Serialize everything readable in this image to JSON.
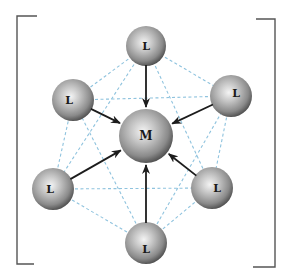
{
  "figure": {
    "central_atom": {
      "id": "M",
      "label": "M",
      "cx": 146,
      "cy": 136,
      "r": 27
    },
    "ligands": [
      {
        "id": "top",
        "label": "L",
        "cx": 146,
        "cy": 46,
        "r": 20,
        "label_dx": 0,
        "label_dy": 0
      },
      {
        "id": "upper-left",
        "label": "L",
        "cx": 73,
        "cy": 100,
        "r": 21,
        "label_dx": -4,
        "label_dy": 0
      },
      {
        "id": "upper-right",
        "label": "L",
        "cx": 231,
        "cy": 96,
        "r": 21,
        "label_dx": 5,
        "label_dy": -3
      },
      {
        "id": "lower-left",
        "label": "L",
        "cx": 53,
        "cy": 189,
        "r": 21,
        "label_dx": -3,
        "label_dy": 0
      },
      {
        "id": "lower-right",
        "label": "L",
        "cx": 212,
        "cy": 188,
        "r": 21,
        "label_dx": 5,
        "label_dy": 0
      },
      {
        "id": "bottom",
        "label": "L",
        "cx": 146,
        "cy": 243,
        "r": 21,
        "label_dx": 0,
        "label_dy": 6
      }
    ],
    "octahedron_edges": [
      [
        "top",
        "upper-left"
      ],
      [
        "top",
        "upper-right"
      ],
      [
        "top",
        "lower-left"
      ],
      [
        "top",
        "lower-right"
      ],
      [
        "bottom",
        "upper-left"
      ],
      [
        "bottom",
        "upper-right"
      ],
      [
        "bottom",
        "lower-left"
      ],
      [
        "bottom",
        "lower-right"
      ],
      [
        "upper-left",
        "upper-right"
      ],
      [
        "lower-left",
        "lower-right"
      ],
      [
        "upper-left",
        "lower-left"
      ],
      [
        "upper-right",
        "lower-right"
      ]
    ],
    "arrows_direction": "ligand-to-metal",
    "colors": {
      "edge_dashed": "#8fc3de",
      "arrow": "#1c1c1c",
      "bracket": "#555555",
      "sphere_light": "#f2f2f2",
      "sphere_mid": "#9a9a9a",
      "sphere_dark": "#3f3f3f"
    },
    "brackets": {
      "left": {
        "x": 17,
        "top": 16,
        "bottom": 264,
        "arm_top": 37,
        "arm_bottom": 34
      },
      "right": {
        "x": 275,
        "top": 19,
        "bottom": 267,
        "arm_top": 256,
        "arm_bottom": 253
      }
    }
  }
}
